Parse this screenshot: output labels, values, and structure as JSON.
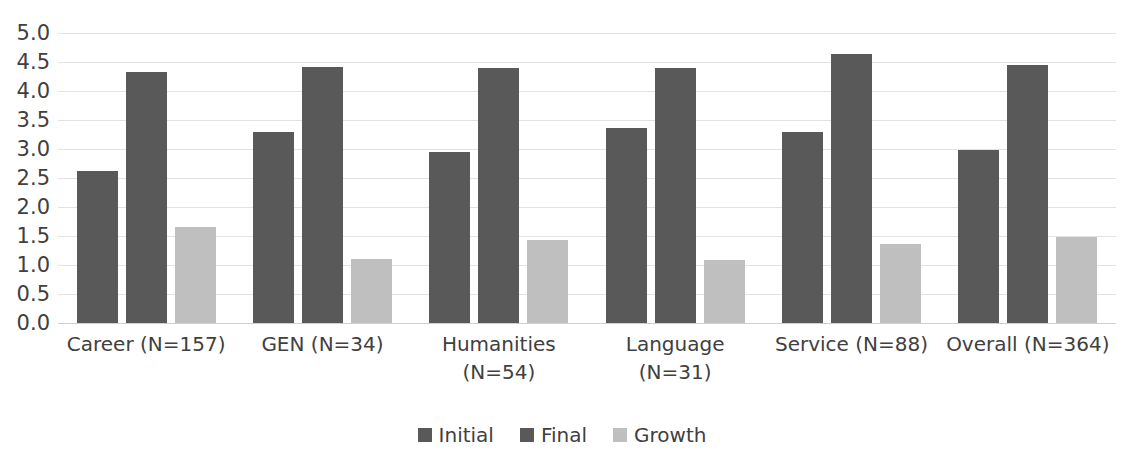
{
  "chart_data": {
    "type": "bar",
    "title": "",
    "subtitle": "",
    "xlabel": "",
    "ylabel": "",
    "ylim": [
      0.0,
      5.0
    ],
    "ytick_step": 0.5,
    "grid": true,
    "legend_position": "bottom-center",
    "categories": [
      "Career (N=157)",
      "GEN (N=34)",
      "Humanities (N=54)",
      "Language (N=31)",
      "Service (N=88)",
      "Overall (N=364)"
    ],
    "category_lines": [
      [
        "Career (N=157)"
      ],
      [
        "GEN (N=34)"
      ],
      [
        "Humanities",
        "(N=54)"
      ],
      [
        "Language",
        "(N=31)"
      ],
      [
        "Service (N=88)"
      ],
      [
        "Overall (N=364)"
      ]
    ],
    "series": [
      {
        "name": "Initial",
        "color": "#595959",
        "values": [
          2.62,
          3.3,
          2.95,
          3.37,
          3.3,
          2.99
        ]
      },
      {
        "name": "Final",
        "color": "#595959",
        "values": [
          4.33,
          4.41,
          4.39,
          4.4,
          4.63,
          4.45
        ]
      },
      {
        "name": "Growth",
        "color": "#bfbfbf",
        "values": [
          1.66,
          1.11,
          1.43,
          1.08,
          1.37,
          1.48
        ]
      }
    ],
    "ytick_labels": [
      "5.0",
      "4.5",
      "4.0",
      "3.5",
      "3.0",
      "2.5",
      "2.0",
      "1.5",
      "1.0",
      "0.5",
      "0.0"
    ],
    "ytick_values": [
      5.0,
      4.5,
      4.0,
      3.5,
      3.0,
      2.5,
      2.0,
      1.5,
      1.0,
      0.5,
      0.0
    ]
  },
  "legend": {
    "items": [
      {
        "label": "Initial",
        "color": "#595959"
      },
      {
        "label": "Final",
        "color": "#595959"
      },
      {
        "label": "Growth",
        "color": "#bfbfbf"
      }
    ]
  },
  "colors": {
    "background": "#ffffff",
    "text": "#404040",
    "gridline": "#e2e2e2",
    "series_dark": "#595959",
    "series_light": "#bfbfbf"
  }
}
